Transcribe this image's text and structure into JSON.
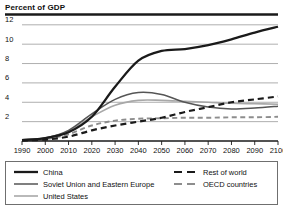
{
  "chart_data": {
    "type": "line",
    "title": "Percent of GDP",
    "xlabel": "",
    "ylabel": "Percent of GDP",
    "xlim": [
      1990,
      2100
    ],
    "ylim": [
      0,
      12.6
    ],
    "grid": true,
    "grid_axis": "y",
    "legend_position": "below-plot",
    "xticks": [
      1990,
      2000,
      2010,
      2020,
      2030,
      2040,
      2050,
      2060,
      2070,
      2080,
      2090,
      2100
    ],
    "yticks": [
      2,
      4,
      6,
      8,
      10,
      12
    ],
    "x": [
      1990,
      2000,
      2010,
      2020,
      2030,
      2040,
      2050,
      2060,
      2070,
      2080,
      2090,
      2100
    ],
    "series": [
      {
        "name": "China",
        "color": "#1a1a1a",
        "style": "solid",
        "width": 2.3,
        "values": [
          0.1,
          0.3,
          0.9,
          2.5,
          5.6,
          8.3,
          9.3,
          9.5,
          9.9,
          10.5,
          11.2,
          11.8
        ]
      },
      {
        "name": "Soviet Union and Eastern Europe",
        "color": "#555555",
        "style": "solid",
        "width": 1.5,
        "values": [
          0.1,
          0.3,
          1.1,
          2.8,
          4.3,
          5.0,
          4.8,
          4.0,
          3.5,
          3.3,
          3.4,
          3.6
        ]
      },
      {
        "name": "United States",
        "color": "#a8a8a8",
        "style": "solid",
        "width": 1.6,
        "values": [
          0.1,
          0.3,
          1.0,
          2.5,
          3.7,
          4.2,
          4.2,
          4.1,
          4.0,
          3.9,
          3.85,
          3.8
        ]
      },
      {
        "name": "Rest of world",
        "color": "#1a1a1a",
        "style": "dashed",
        "width": 2.2,
        "values": [
          0.05,
          0.15,
          0.45,
          1.1,
          1.6,
          2.0,
          2.4,
          3.0,
          3.5,
          4.0,
          4.3,
          4.6
        ]
      },
      {
        "name": "OECD countries",
        "color": "#8d8d8d",
        "style": "dashed",
        "width": 1.9,
        "values": [
          0.05,
          0.2,
          0.7,
          1.6,
          2.1,
          2.3,
          2.35,
          2.4,
          2.4,
          2.45,
          2.45,
          2.5
        ]
      }
    ]
  },
  "legend": {
    "left_entries": [
      {
        "label": "China",
        "key": "china"
      },
      {
        "label": "Soviet Union and Eastern Europe",
        "key": "soviet-union-eastern-europe"
      },
      {
        "label": "United States",
        "key": "united-states"
      }
    ],
    "right_entries": [
      {
        "label": "Rest of world",
        "key": "rest-of-world"
      },
      {
        "label": "OECD countries",
        "key": "oecd-countries"
      }
    ]
  },
  "colors": {
    "china": "#1a1a1a",
    "soviet": "#555555",
    "united_states": "#a8a8a8",
    "rest_of_world": "#1a1a1a",
    "oecd": "#8d8d8d",
    "gridline": "#9a9a9a",
    "axis": "#1a1a1a",
    "legend_border": "#6f6f6f"
  }
}
